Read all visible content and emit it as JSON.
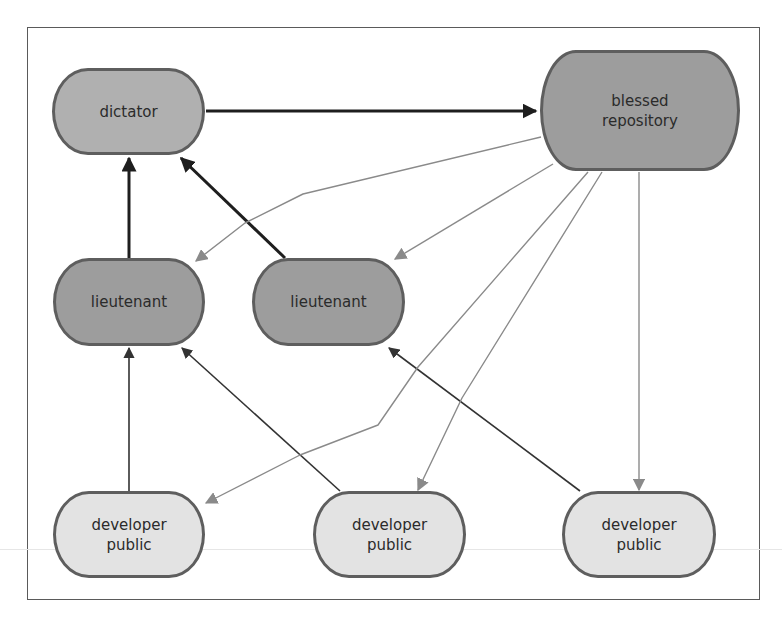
{
  "diagram": {
    "title": "",
    "nodes": [
      {
        "id": "dictator",
        "label": "dictator",
        "shade": "mid",
        "x": 52,
        "y": 68,
        "w": 153,
        "h": 87
      },
      {
        "id": "blessed",
        "label": "blessed\nrepository",
        "shade": "dark",
        "x": 540,
        "y": 50,
        "w": 200,
        "h": 121
      },
      {
        "id": "lieutenant1",
        "label": "lieutenant",
        "shade": "dark",
        "x": 53,
        "y": 258,
        "w": 152,
        "h": 88
      },
      {
        "id": "lieutenant2",
        "label": "lieutenant",
        "shade": "dark",
        "x": 252,
        "y": 258,
        "w": 153,
        "h": 88
      },
      {
        "id": "developer1",
        "label": "developer\npublic",
        "shade": "light",
        "x": 53,
        "y": 491,
        "w": 152,
        "h": 87
      },
      {
        "id": "developer2",
        "label": "developer\npublic",
        "shade": "light",
        "x": 313,
        "y": 491,
        "w": 153,
        "h": 87
      },
      {
        "id": "developer3",
        "label": "developer\npublic",
        "shade": "light",
        "x": 562,
        "y": 491,
        "w": 154,
        "h": 87
      }
    ],
    "edges": [
      {
        "from": "dictator",
        "to": "blessed",
        "style": "bold",
        "points": [
          [
            206,
            111
          ],
          [
            536,
            111
          ]
        ]
      },
      {
        "from": "lieutenant1",
        "to": "dictator",
        "style": "bold",
        "points": [
          [
            129,
            258
          ],
          [
            129,
            158
          ]
        ]
      },
      {
        "from": "lieutenant2",
        "to": "dictator",
        "style": "bold",
        "points": [
          [
            285,
            258
          ],
          [
            181,
            158
          ]
        ]
      },
      {
        "from": "developer1",
        "to": "lieutenant1",
        "style": "normal",
        "points": [
          [
            129,
            491
          ],
          [
            129,
            348
          ]
        ]
      },
      {
        "from": "developer2",
        "to": "lieutenant1",
        "style": "normal",
        "points": [
          [
            340,
            491
          ],
          [
            182,
            348
          ]
        ]
      },
      {
        "from": "developer3",
        "to": "lieutenant2",
        "style": "normal",
        "points": [
          [
            580,
            491
          ],
          [
            389,
            348
          ]
        ]
      },
      {
        "from": "blessed",
        "to": "lieutenant1",
        "style": "light",
        "points": [
          [
            541,
            137
          ],
          [
            303,
            194
          ],
          [
            245,
            223
          ],
          [
            196,
            261
          ]
        ]
      },
      {
        "from": "blessed",
        "to": "lieutenant2",
        "style": "light",
        "points": [
          [
            553,
            164
          ],
          [
            395,
            259
          ]
        ]
      },
      {
        "from": "blessed",
        "to": "developer1",
        "style": "light",
        "points": [
          [
            588,
            172
          ],
          [
            418,
            367
          ],
          [
            378,
            425
          ],
          [
            300,
            455
          ],
          [
            206,
            503
          ]
        ]
      },
      {
        "from": "blessed",
        "to": "developer2",
        "style": "light",
        "points": [
          [
            602,
            172
          ],
          [
            462,
            398
          ],
          [
            418,
            490
          ]
        ]
      },
      {
        "from": "blessed",
        "to": "developer3",
        "style": "light",
        "points": [
          [
            639,
            172
          ],
          [
            639,
            490
          ]
        ]
      }
    ],
    "colors": {
      "frame": "#5a5a5a",
      "node_border": "#5e5e5e",
      "bold_edge": "#1e1e1e",
      "normal_edge": "#333333",
      "light_edge": "#8a8a8a"
    }
  }
}
